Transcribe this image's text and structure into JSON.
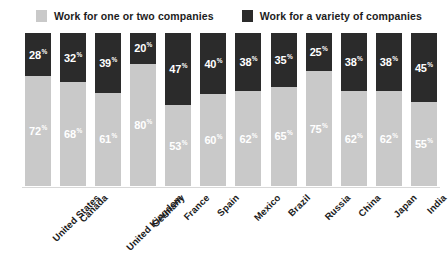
{
  "legend": {
    "items": [
      {
        "label": "Work for one or two companies",
        "color": "#c9c9c9",
        "key": "light"
      },
      {
        "label": "Work for a variety of companies",
        "color": "#2b2b2b",
        "key": "dark"
      }
    ]
  },
  "axis": {
    "percent_suffix": "%"
  },
  "chart_data": {
    "type": "bar",
    "subtype": "stacked-100-percent",
    "orientation": "vertical",
    "title": "",
    "subtitle": "",
    "xlabel": "",
    "ylabel": "",
    "ylim": [
      0,
      100
    ],
    "grid": false,
    "legend_position": "top-left",
    "value_suffix": "%",
    "categories": [
      "United States",
      "Canada",
      "United Kingdom",
      "Germany",
      "France",
      "Spain",
      "Mexico",
      "Brazil",
      "Russia",
      "China",
      "Japan",
      "India"
    ],
    "series": [
      {
        "name": "Work for a variety of companies",
        "color": "#2b2b2b",
        "values": [
          28,
          32,
          39,
          20,
          47,
          40,
          38,
          35,
          25,
          38,
          38,
          45
        ]
      },
      {
        "name": "Work for one or two companies",
        "color": "#c9c9c9",
        "values": [
          72,
          68,
          61,
          80,
          53,
          60,
          62,
          65,
          75,
          62,
          62,
          55
        ]
      }
    ],
    "bars": [
      {
        "category": "United States",
        "dark": 28,
        "light": 72
      },
      {
        "category": "Canada",
        "dark": 32,
        "light": 68
      },
      {
        "category": "United Kingdom",
        "dark": 39,
        "light": 61
      },
      {
        "category": "Germany",
        "dark": 20,
        "light": 80
      },
      {
        "category": "France",
        "dark": 47,
        "light": 53
      },
      {
        "category": "Spain",
        "dark": 40,
        "light": 60
      },
      {
        "category": "Mexico",
        "dark": 38,
        "light": 62
      },
      {
        "category": "Brazil",
        "dark": 35,
        "light": 65
      },
      {
        "category": "Russia",
        "dark": 25,
        "light": 75
      },
      {
        "category": "China",
        "dark": 38,
        "light": 62
      },
      {
        "category": "Japan",
        "dark": 38,
        "light": 62
      },
      {
        "category": "India",
        "dark": 45,
        "light": 55
      }
    ]
  }
}
